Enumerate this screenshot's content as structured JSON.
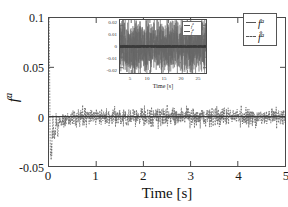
{
  "chart_data": {
    "type": "line",
    "title": "",
    "xlabel": "Time [s]",
    "ylabel": "fᵃ",
    "ylabel_base": "f",
    "ylabel_sup": "a",
    "xlim": [
      0,
      5
    ],
    "ylim": [
      -0.05,
      0.1
    ],
    "xticks": [
      0,
      1,
      2,
      3,
      4,
      5
    ],
    "xticklabels": [
      "0",
      "1",
      "2",
      "3",
      "4",
      "5"
    ],
    "yticks": [
      -0.05,
      0,
      0.05,
      0.1
    ],
    "yticklabels": [
      "-0.05",
      "0",
      "0.05",
      "0.1"
    ],
    "grid": false,
    "legend_position": "upper right",
    "series": [
      {
        "name": "fᵃ",
        "label_base": "f",
        "label_sup": "a",
        "style": "solid",
        "color": "#555555",
        "description": "true actuator fault signal, flat at zero over 0-5 s",
        "x": [
          0,
          5
        ],
        "y": [
          0,
          0
        ]
      },
      {
        "name": "f̂ᵃ",
        "label_base": "f̂",
        "label_sup": "a",
        "style": "dashed",
        "color": "#666666",
        "description": "estimated actuator fault, noisy about zero with a large transient spike near t=0 reaching 0.1 and a negative excursion to -0.04 near t=0.2",
        "noise_band": [
          -0.012,
          0.012
        ],
        "transient_peak": 0.1,
        "transient_min": -0.04,
        "settling_time_s": 0.45
      }
    ],
    "inset": {
      "type": "line",
      "xlabel": "Time [s]",
      "ylabel": "",
      "xlim": [
        2,
        25
      ],
      "ylim": [
        -0.025,
        0.025
      ],
      "xticks": [
        5,
        10,
        15,
        20,
        25
      ],
      "xticklabels": [
        "5",
        "10",
        "15",
        "20",
        "25"
      ],
      "yticks": [
        -0.02,
        -0.01,
        0,
        0.01,
        0.02
      ],
      "yticklabels": [
        "-0.02",
        "-0.01",
        "0",
        "0.01",
        "0.02"
      ],
      "grid": false,
      "legend_position": "upper right",
      "series": [
        {
          "name": "fᵃ",
          "label_base": "f",
          "label_sup": "a",
          "style": "solid",
          "color": "#555555",
          "noise_band": [
            -0.002,
            0.002
          ]
        },
        {
          "name": "f̂ᵃ",
          "label_base": "f̂",
          "label_sup": "a",
          "style": "dashed",
          "color": "#666666",
          "noise_band": [
            -0.022,
            0.022
          ]
        }
      ]
    }
  },
  "main": {
    "xlabel": "Time [s]",
    "ylabel_base": "f",
    "ylabel_sup": "a"
  },
  "inset": {
    "xlabel": "Time [s]"
  },
  "legend": {
    "entries": [
      {
        "base": "f",
        "sup": "a",
        "style": "solid"
      },
      {
        "base": "f̂",
        "sup": "a",
        "style": "dashed"
      }
    ]
  }
}
